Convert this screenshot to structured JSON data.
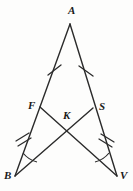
{
  "figure": {
    "background_color": "#fdfdfc",
    "stroke_color": "#2b2b2b",
    "label_color": "#1a1a1a"
  },
  "vertices": {
    "A": {
      "label": "A",
      "x": 70,
      "y": 24,
      "label_x": 68,
      "label_y": 5
    },
    "F": {
      "label": "F",
      "x": 40,
      "y": 107,
      "label_x": 28,
      "label_y": 100
    },
    "S": {
      "label": "S",
      "x": 93,
      "y": 108,
      "label_x": 99,
      "label_y": 101
    },
    "K": {
      "label": "K",
      "x": 67,
      "y": 131,
      "label_x": 63,
      "label_y": 110
    },
    "B": {
      "label": "B",
      "x": 15,
      "y": 176,
      "label_x": 4,
      "label_y": 170
    },
    "V": {
      "label": "V",
      "x": 117,
      "y": 176,
      "label_x": 120,
      "label_y": 170
    }
  },
  "segments": [
    {
      "name": "A-F",
      "from": "A",
      "to": "F",
      "ticks": 1
    },
    {
      "name": "A-S",
      "from": "A",
      "to": "S",
      "ticks": 1
    },
    {
      "name": "F-B",
      "from": "F",
      "to": "B",
      "ticks": 2
    },
    {
      "name": "S-V",
      "from": "S",
      "to": "V",
      "ticks": 2
    },
    {
      "name": "F-V",
      "from": "F",
      "to": "V",
      "ticks": 0
    },
    {
      "name": "S-B",
      "from": "S",
      "to": "B",
      "ticks": 0
    }
  ],
  "angle_marks": [
    {
      "name": "angle-at-B",
      "vertex": "B",
      "arcs": 1
    },
    {
      "name": "angle-at-V",
      "vertex": "V",
      "arcs": 1
    }
  ],
  "tick_marks": {
    "single_upper_left": {
      "x": 54,
      "y": 70
    },
    "single_upper_right": {
      "x": 86,
      "y": 71
    },
    "double_lower_left": {
      "x": 23,
      "y": 141
    },
    "double_lower_right": {
      "x": 108,
      "y": 141
    }
  }
}
